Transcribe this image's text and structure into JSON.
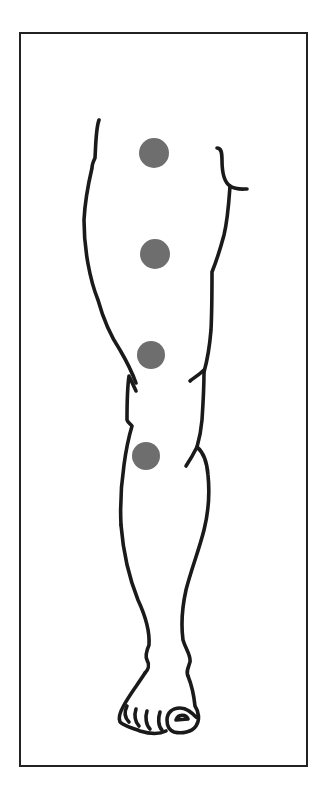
{
  "figure": {
    "type": "anatomical line drawing",
    "frame": {
      "left": 19,
      "top": 32,
      "right": 306,
      "bottom": 765,
      "border_color": "#222222"
    },
    "outline_color": "#1a1a1a",
    "background_color": "#ffffff"
  },
  "markers": {
    "color": "#6e6e6e",
    "radius": 15,
    "points": [
      {
        "id": "marker-1",
        "region": "upper thigh",
        "cx": 154,
        "cy": 153
      },
      {
        "id": "marker-2",
        "region": "mid thigh",
        "cx": 155,
        "cy": 254
      },
      {
        "id": "marker-3",
        "region": "lower thigh",
        "cx": 151,
        "cy": 355
      },
      {
        "id": "marker-4",
        "region": "below knee",
        "cx": 146,
        "cy": 456
      }
    ]
  }
}
